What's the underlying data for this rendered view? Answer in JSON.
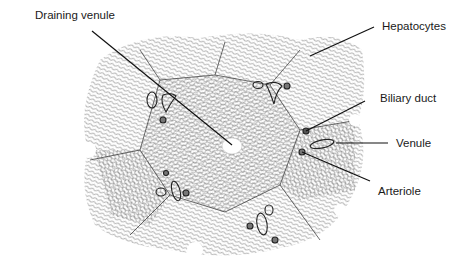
{
  "diagram": {
    "type": "anatomical-illustration",
    "labels": [
      {
        "id": "draining-venule",
        "text": "Draining venule",
        "x": 35,
        "y": 9,
        "target": [
          232,
          145
        ]
      },
      {
        "id": "hepatocytes",
        "text": "Hepatocytes",
        "x": 382,
        "y": 20,
        "target": [
          310,
          56
        ]
      },
      {
        "id": "biliary-duct",
        "text": "Biliary duct",
        "x": 380,
        "y": 92,
        "target": [
          305,
          131
        ]
      },
      {
        "id": "venule",
        "text": "Venule",
        "x": 396,
        "y": 140,
        "target": [
          340,
          144
        ]
      },
      {
        "id": "arteriole",
        "text": "Arteriole",
        "x": 378,
        "y": 185,
        "target": [
          302,
          152
        ]
      }
    ],
    "colors": {
      "ink": "#1a1a1a",
      "hatch": "#555555",
      "background": "#ffffff"
    }
  }
}
